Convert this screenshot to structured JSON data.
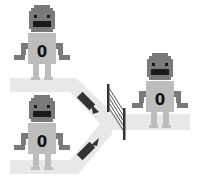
{
  "diagram": {
    "colors": {
      "path": "#e6e6e6",
      "robot_head": "#7a7a7a",
      "robot_body": "#bdbdbd",
      "robot_arm": "#7a7a7a",
      "eye": "#1a1a1a",
      "arrow": "#333333",
      "gate": "#333333"
    },
    "robots": [
      {
        "id": "robot-top-left",
        "label": "0"
      },
      {
        "id": "robot-bottom-left",
        "label": "0"
      },
      {
        "id": "robot-right",
        "label": "0"
      }
    ],
    "arrows": [
      {
        "id": "arrow-top",
        "direction": "down-right"
      },
      {
        "id": "arrow-bottom",
        "direction": "up-right"
      }
    ],
    "gate": {
      "id": "gate"
    }
  }
}
